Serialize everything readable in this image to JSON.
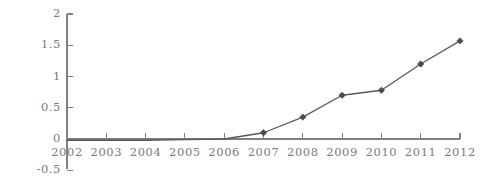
{
  "chart_data": {
    "type": "line",
    "title": "",
    "subtitle": "",
    "xlabel": "",
    "ylabel": "",
    "categories": [
      "2002",
      "2003",
      "2004",
      "2005",
      "2006",
      "2007",
      "2008",
      "2009",
      "2010",
      "2011",
      "2012"
    ],
    "x": [
      2002,
      2003,
      2004,
      2005,
      2006,
      2007,
      2008,
      2009,
      2010,
      2011,
      2012
    ],
    "values": [
      -0.02,
      -0.02,
      -0.02,
      -0.01,
      0.0,
      0.1,
      0.35,
      0.7,
      0.78,
      1.2,
      1.57
    ],
    "series": [
      {
        "name": "",
        "values": [
          -0.02,
          -0.02,
          -0.02,
          -0.01,
          0.0,
          0.1,
          0.35,
          0.7,
          0.78,
          1.2,
          1.57
        ]
      }
    ],
    "ylim": [
      -0.5,
      2
    ],
    "xlim": [
      2002,
      2012
    ],
    "ytick_labels": [
      "2",
      "1.5",
      "1",
      "0.5",
      "0",
      "-0.5"
    ],
    "ytick_values": [
      2,
      1.5,
      1,
      0.5,
      0,
      -0.5
    ],
    "xtick_labels": [
      "2002",
      "2003",
      "2004",
      "2005",
      "2006",
      "2007",
      "2008",
      "2009",
      "2010",
      "2011",
      "2012"
    ],
    "grid": false,
    "legend": "none",
    "marker": "diamond",
    "line_color": "#595959",
    "marker_color": "#4a4a4a",
    "axis_color": "#808080",
    "label_color": "#7a7a7a",
    "background_color": "#ffffff"
  }
}
